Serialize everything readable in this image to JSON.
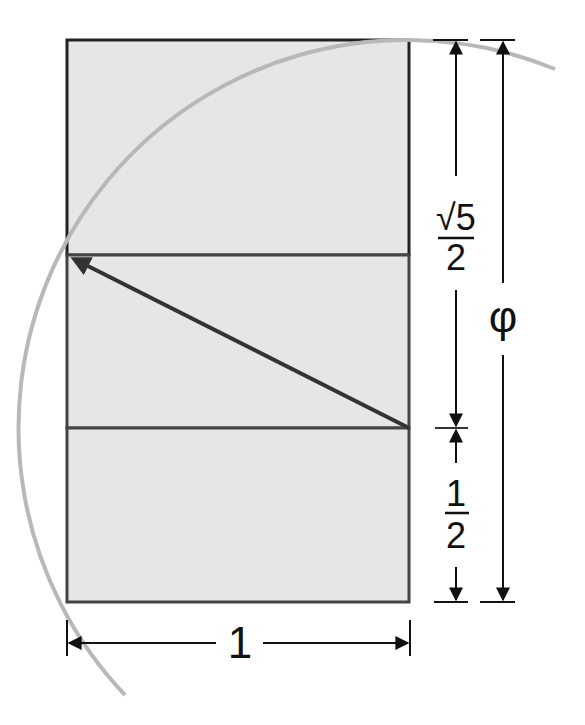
{
  "diagram": {
    "labels": {
      "sqrt5_num": "√5",
      "sqrt5_den": "2",
      "half_num": "1",
      "half_den": "2",
      "phi": "φ",
      "width": "1"
    },
    "colors": {
      "fill": "#e6e6e6",
      "stroke": "#333333",
      "arc": "#b8b8b8",
      "dimension": "#111111"
    }
  }
}
